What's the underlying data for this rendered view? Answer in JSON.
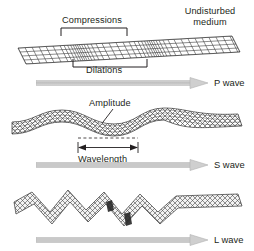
{
  "figure": {
    "width": 254,
    "height": 251,
    "background": "#ffffff",
    "ink_color": "#231f20",
    "mesh_color": "#3a3a3a",
    "arrow_fill": "#c9c9c9",
    "arrow_stroke": "#aaaaaa"
  },
  "panels": [
    {
      "id": "p-wave",
      "wave_type": "P wave",
      "wave_label": "P wave",
      "description": "Compressional body wave shown as a flat grid slab with alternating dense and sparse grid columns",
      "mesh_style": "rectangular-grid",
      "annotations": [
        {
          "name": "compressions",
          "label": "Compressions",
          "bracket": "below-text",
          "position": "above-slab"
        },
        {
          "name": "dilations",
          "label": "Dilations",
          "bracket": "above-text",
          "position": "below-slab"
        },
        {
          "name": "undisturbed-medium",
          "label": "Undisturbed\nmedium",
          "line1": "Undisturbed",
          "line2": "medium",
          "position": "top-right"
        }
      ]
    },
    {
      "id": "s-wave",
      "wave_type": "S wave",
      "wave_label": "S wave",
      "description": "Shear body wave shown as a diagonal cross-hatch slab undulating sinusoidally up and down",
      "mesh_style": "diagonal-crosshatch",
      "annotations": [
        {
          "name": "amplitude",
          "label": "Amplitude",
          "leader": "down-left",
          "position": "above-crest"
        },
        {
          "name": "wavelength",
          "label": "Wavelength",
          "measure": "double-headed-arrow",
          "position": "below-trough"
        }
      ]
    },
    {
      "id": "l-wave",
      "wave_type": "L wave",
      "wave_label": "L wave",
      "description": "Surface love wave shown as a zigzag sawtooth cross-hatch band flattening to the right",
      "mesh_style": "diagonal-crosshatch",
      "annotations": []
    }
  ],
  "labels": {
    "compressions": "Compressions",
    "dilations": "Dilations",
    "undisturbed_line1": "Undisturbed",
    "undisturbed_line2": "medium",
    "amplitude": "Amplitude",
    "wavelength": "Wavelength",
    "p_wave": "P wave",
    "s_wave": "S wave",
    "l_wave": "L wave"
  },
  "icons": {
    "direction_arrow": "right-arrow-icon",
    "measure_arrow": "double-headed-arrow-icon",
    "bracket": "bracket-icon",
    "leader_line": "leader-line-icon"
  }
}
